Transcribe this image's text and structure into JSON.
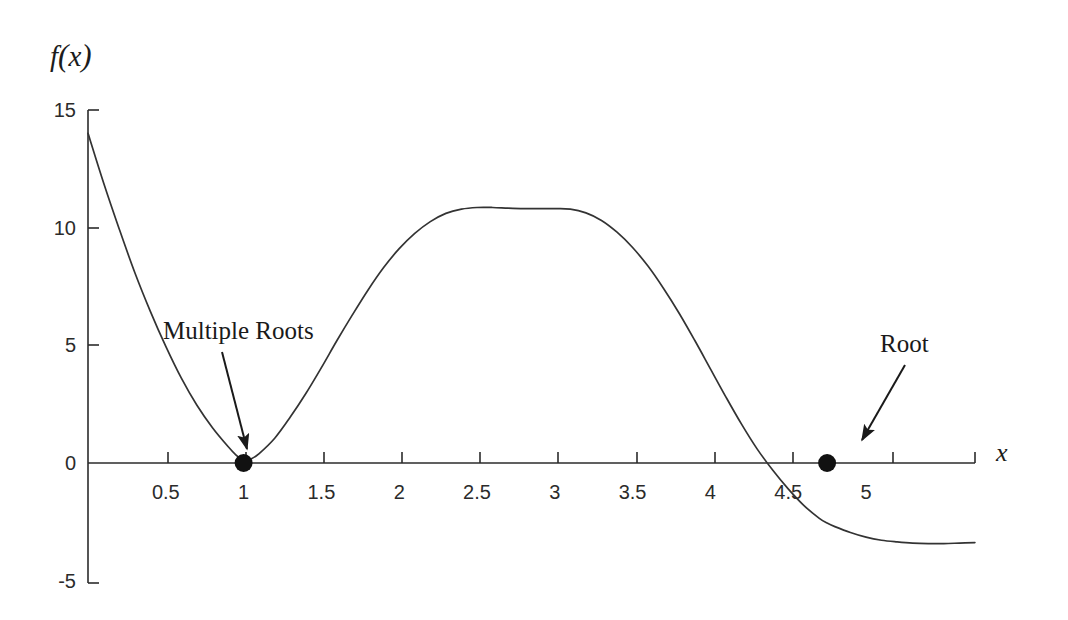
{
  "chart_data": {
    "type": "line",
    "title": "",
    "subtitle": "",
    "xlabel": "x",
    "ylabel": "f(x)",
    "xlim": [
      0,
      5.7
    ],
    "ylim": [
      -5,
      15
    ],
    "grid": false,
    "legend": "none",
    "x_ticks": [
      {
        "value": 0.5,
        "label": "0.5"
      },
      {
        "value": 1,
        "label": "1"
      },
      {
        "value": 1.5,
        "label": "1.5"
      },
      {
        "value": 2,
        "label": "2"
      },
      {
        "value": 2.5,
        "label": "2.5"
      },
      {
        "value": 3,
        "label": "3"
      },
      {
        "value": 3.5,
        "label": "3.5"
      },
      {
        "value": 4,
        "label": "4"
      },
      {
        "value": 4.5,
        "label": "4.5"
      },
      {
        "value": 5,
        "label": "5"
      }
    ],
    "y_ticks": [
      {
        "value": 15,
        "label": "15"
      },
      {
        "value": 10,
        "label": "10"
      },
      {
        "value": 5,
        "label": "5"
      },
      {
        "value": 0,
        "label": "0"
      },
      {
        "value": -5,
        "label": "-5"
      }
    ],
    "series": [
      {
        "name": "f(x)",
        "color": "#333333",
        "x": [
          0.0,
          0.1,
          0.2,
          0.3,
          0.4,
          0.5,
          0.6,
          0.7,
          0.8,
          0.9,
          0.95,
          1.0,
          1.05,
          1.1,
          1.2,
          1.3,
          1.4,
          1.5,
          1.6,
          1.7,
          1.8,
          1.9,
          2.0,
          2.1,
          2.2,
          2.3,
          2.4,
          2.5,
          2.6,
          2.7,
          2.8,
          2.9,
          3.0,
          3.1,
          3.2,
          3.3,
          3.4,
          3.5,
          3.6,
          3.7,
          3.8,
          3.9,
          4.0,
          4.1,
          4.2,
          4.3,
          4.4,
          4.5,
          4.6,
          4.7,
          4.75,
          4.8,
          4.9,
          5.0,
          5.1,
          5.2,
          5.3,
          5.4,
          5.5,
          5.6,
          5.7
        ],
        "y": [
          14.0,
          11.9,
          9.95,
          8.1,
          6.45,
          4.95,
          3.6,
          2.45,
          1.5,
          0.7,
          0.35,
          0.1,
          0.18,
          0.4,
          1.05,
          1.95,
          2.95,
          4.05,
          5.2,
          6.3,
          7.35,
          8.3,
          9.1,
          9.75,
          10.25,
          10.6,
          10.78,
          10.85,
          10.85,
          10.82,
          10.8,
          10.8,
          10.8,
          10.78,
          10.62,
          10.3,
          9.8,
          9.15,
          8.35,
          7.4,
          6.35,
          5.2,
          4.0,
          2.8,
          1.65,
          0.6,
          -0.3,
          -1.1,
          -1.8,
          -2.35,
          -2.55,
          -2.7,
          -2.95,
          -3.15,
          -3.28,
          -3.35,
          -3.4,
          -3.42,
          -3.42,
          -3.4,
          -3.38
        ]
      }
    ],
    "markers": [
      {
        "name": "multiple-root",
        "x": 1.0,
        "y": 0.0,
        "radius": 9,
        "color": "#111111"
      },
      {
        "name": "simple-root",
        "x": 4.75,
        "y": 0.0,
        "radius": 9,
        "color": "#111111"
      }
    ],
    "annotations": [
      {
        "name": "multiple-roots",
        "text": "Multiple Roots",
        "text_x_px": 163,
        "text_y_px": 318,
        "arrow_from_px": [
          222,
          352
        ],
        "arrow_to_px": [
          247,
          449
        ]
      },
      {
        "name": "root",
        "text": "Root",
        "text_x_px": 880,
        "text_y_px": 331,
        "arrow_from_px": [
          905,
          365
        ],
        "arrow_to_px": [
          862,
          440
        ]
      }
    ]
  },
  "figure": {
    "axis_color": "#2b2b2b",
    "curve_color": "#333333",
    "background": "#ffffff",
    "arrow_color": "#1a1a1a"
  }
}
